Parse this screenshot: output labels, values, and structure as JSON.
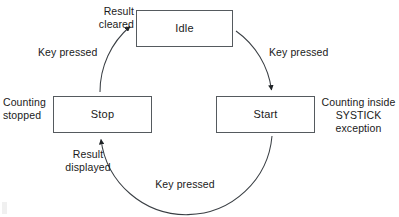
{
  "diagram": {
    "type": "state-transition-diagram",
    "states": [
      {
        "id": "idle",
        "label": "Idle",
        "x": 136,
        "y": 10,
        "w": 97,
        "h": 37
      },
      {
        "id": "stop",
        "label": "Stop",
        "x": 53,
        "y": 96,
        "w": 99,
        "h": 37
      },
      {
        "id": "start",
        "label": "Start",
        "x": 216,
        "y": 96,
        "w": 99,
        "h": 37
      }
    ],
    "transitions": [
      {
        "id": "idle-to-start",
        "from": "Idle",
        "to": "Start",
        "label": "Key pressed"
      },
      {
        "id": "start-to-stop",
        "from": "Start",
        "to": "Stop",
        "label": "Key pressed"
      },
      {
        "id": "stop-to-idle",
        "from": "Stop",
        "to": "Idle",
        "label": "Key pressed"
      }
    ],
    "annotations": {
      "result_cleared": "Result\ncleared",
      "counting_stopped": "Counting\nstopped",
      "result_displayed": "Result\ndisplayed",
      "counting_inside": "Counting inside\nSYSTICK\nexception"
    },
    "edge_labels": {
      "top_left": "Key pressed",
      "top_right": "Key pressed",
      "bottom": "Key pressed"
    },
    "style": {
      "line_color": "#3a3f44",
      "box_border_color": "#555a5e",
      "box_fill": "#ffffff",
      "text_color": "#1a1a1a",
      "background": "#ffffff"
    }
  }
}
